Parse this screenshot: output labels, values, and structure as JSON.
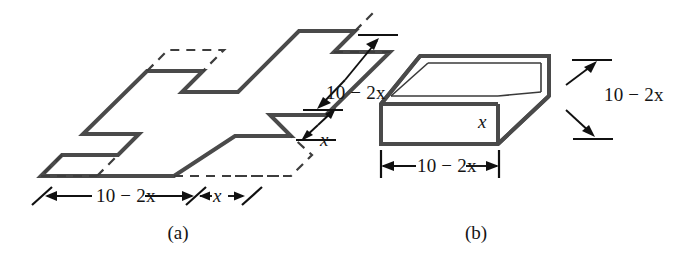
{
  "figure": {
    "panel_a": {
      "caption": "(a)",
      "description": "flat sheet with square corners removed",
      "labels": {
        "bottom_long": "10 − 2x",
        "bottom_short": "x",
        "right_long": "10 − 2x",
        "right_short": "x"
      }
    },
    "panel_b": {
      "caption": "(b)",
      "description": "open box formed by folding up the flaps",
      "labels": {
        "bottom_width": "10 − 2x",
        "right_depth": "10 − 2x",
        "height": "x"
      }
    },
    "colors": {
      "outline": "#4a4a4a",
      "dashed": "#3d3d3d",
      "dimension": "#111111",
      "background": "#ffffff"
    }
  }
}
